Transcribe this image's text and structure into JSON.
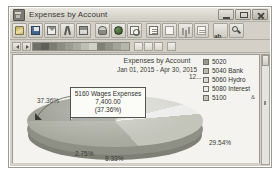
{
  "window": {
    "title": "Expenses by Account",
    "icon": "report-window-icon",
    "controls": {
      "minimize": "Minimize",
      "maximize": "Maximize",
      "close": "Close"
    }
  },
  "toolbar": {
    "buttons": [
      {
        "name": "open-button",
        "icon": "folder-open-icon",
        "label": ""
      },
      {
        "name": "save-button",
        "icon": "floppy-disk-icon",
        "label": ""
      },
      {
        "name": "email-button",
        "icon": "envelope-icon",
        "label": ""
      },
      {
        "name": "cut-button",
        "icon": "scissors-icon",
        "label": ""
      },
      {
        "name": "print-button",
        "icon": "printer-icon",
        "label": ""
      },
      {
        "name": "print-preview-button",
        "icon": "print-preview-icon",
        "label": ""
      },
      {
        "name": "globe-button",
        "icon": "globe-icon",
        "label": ""
      },
      {
        "name": "find-button",
        "icon": "magnifier-icon",
        "label": ""
      },
      {
        "name": "report-button",
        "icon": "document-icon",
        "label": ""
      },
      {
        "name": "report-detail-button",
        "icon": "document-lines-icon",
        "label": ""
      },
      {
        "name": "columns-button",
        "icon": "bar-chart-icon",
        "label": ""
      },
      {
        "name": "grid-button",
        "icon": "grid-icon",
        "label": ""
      },
      {
        "name": "text-button",
        "icon": "text-ab-icon",
        "label": "ab"
      },
      {
        "name": "zoom-button",
        "icon": "zoom-icon",
        "label": ""
      }
    ],
    "text_button_label": "ab"
  },
  "sub_toolbar": {
    "prev_label": "◀",
    "next_label": "▶",
    "palette": [
      "#6e6f66",
      "#5f6057",
      "#7b7c72",
      "#8b8c82",
      "#9a9b91",
      "#a9aaa0",
      "#bcbdb3",
      "#cfd0c6",
      "#7f8076",
      "#909187",
      "#a2a399",
      "#b4b5ab"
    ]
  },
  "chart": {
    "title": "Expenses by Account",
    "subtitle": "Jan 01, 2015 - Apr 30, 2015",
    "value_stub": "12...",
    "legend_extra": "&"
  },
  "legend": {
    "items": [
      {
        "label": "5020",
        "color": "#9a9c91"
      },
      {
        "label": "5040 Bank",
        "color": "#b9bab0"
      },
      {
        "label": "5060 Hydro",
        "color": "#d7d8d0"
      },
      {
        "label": "5080 Interest",
        "color": "#ececea"
      },
      {
        "label": "5100",
        "color": "#c3c4ba"
      }
    ]
  },
  "callout": {
    "account": "5160 Wages Expenses",
    "amount": "7,400.00",
    "percent": "(37.36%)"
  },
  "chart_data": {
    "type": "pie",
    "title": "Expenses by Account",
    "subtitle": "Jan 01, 2015 - Apr 30, 2015",
    "categories": [
      "5160 Wages Expenses",
      "5020",
      "5040 Bank",
      "5060 Hydro",
      "5080 Interest",
      "5100"
    ],
    "values": [
      7400.0,
      null,
      null,
      null,
      null,
      null
    ],
    "percents": [
      37.36,
      29.54,
      8.33,
      8.33,
      2.75,
      8.33
    ],
    "labels_shown": [
      "37.36%",
      "29.54%",
      "8.33%",
      "2.75%"
    ],
    "colors": [
      "#a9aa9f",
      "#9a9c91",
      "#b9bab0",
      "#d7d8d0",
      "#ececea",
      "#c3c4ba"
    ],
    "legend_position": "right",
    "grid": false,
    "three_d": true,
    "highlighted_slice": "5160 Wages Expenses",
    "highlighted_value": "7,400.00",
    "highlighted_percent": "(37.36%)"
  },
  "pie_labels": {
    "left": "37.36%",
    "right": "29.54%",
    "bottom_left": "2.75%",
    "bottom_right": "8.33%"
  }
}
